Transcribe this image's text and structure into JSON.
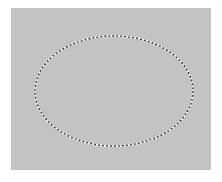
{
  "canvas": {
    "background_color": "#c3c3c3",
    "border_color": "#ffffff"
  },
  "selection": {
    "shape": "ellipse",
    "style": "marching-ants",
    "cx": 114,
    "cy": 91,
    "rx": 79,
    "ry": 55,
    "dash_dark": "#333333",
    "dash_light": "#ffffff"
  }
}
